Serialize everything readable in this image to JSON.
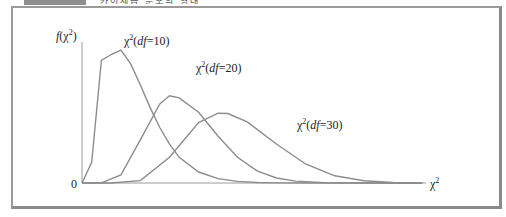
{
  "caption": {
    "tab_color": "#8f8f8f",
    "text": "카이제곱 분포의 형태"
  },
  "chart_data": {
    "type": "line",
    "title": "",
    "xlabel": "χ²",
    "ylabel": "f(χ²)",
    "origin_label": "0",
    "grid": false,
    "legend_position": "inline-labels",
    "x_range": [
      0,
      70
    ],
    "y_range": [
      0,
      0.1
    ],
    "values_source": "computed from the chi-square pdf f(x;k), not measured from the image (the plot has no y-axis ticks)",
    "pixel_mapping": {
      "note": "x pixel = origin_x + x * px_per_unit; y pixel = origin_y - f * px_per_density. px_per_unit fit so curves fade out near the observed convergence point (~x=400); approximate.",
      "origin_x": 82,
      "origin_y": 183,
      "px_per_unit": 4.86,
      "px_per_density": 1360
    },
    "series": [
      {
        "name": "χ²(df=10)",
        "df": 10,
        "mode_x": 8,
        "x": [
          0,
          2,
          4,
          6,
          8,
          10,
          12,
          14,
          16,
          18,
          20,
          24,
          28,
          32,
          36,
          40,
          50,
          60,
          70
        ],
        "values": [
          0,
          0.0153,
          0.0902,
          0.0945,
          0.0977,
          0.0877,
          0.0723,
          0.0556,
          0.0408,
          0.0286,
          0.0189,
          0.0081,
          0.0032,
          0.0012,
          0.0004,
          0.0001,
          0,
          0,
          0
        ]
      },
      {
        "name": "χ²(df=20)",
        "df": 20,
        "mode_x": 18,
        "x": [
          0,
          4,
          8,
          12,
          16,
          18,
          20,
          24,
          28,
          32,
          36,
          40,
          44,
          50,
          60,
          70
        ],
        "values": [
          0,
          0.0001,
          0.0059,
          0.0317,
          0.0581,
          0.0641,
          0.0626,
          0.052,
          0.0344,
          0.0189,
          0.009,
          0.0037,
          0.0014,
          0.0003,
          0,
          0
        ]
      },
      {
        "name": "χ²(df=30)",
        "df": 30,
        "mode_x": 28,
        "x": [
          0,
          6,
          12,
          18,
          24,
          28,
          30,
          34,
          40,
          46,
          52,
          58,
          64,
          70
        ],
        "values": [
          0,
          0,
          0.0018,
          0.0189,
          0.0445,
          0.0513,
          0.0511,
          0.0449,
          0.0287,
          0.014,
          0.0053,
          0.0016,
          0.0004,
          0.0001
        ]
      }
    ],
    "labels": [
      {
        "text_prefix": "χ",
        "sup": "2",
        "text_mid": "(",
        "italic": "df",
        "text_suffix": "=10)"
      },
      {
        "text_prefix": "χ",
        "sup": "2",
        "text_mid": "(",
        "italic": "df",
        "text_suffix": "=20)"
      },
      {
        "text_prefix": "χ",
        "sup": "2",
        "text_mid": "(",
        "italic": "df",
        "text_suffix": "=30)"
      }
    ],
    "colors": {
      "curve": "#8c8c8c",
      "axis": "#9a9a9a",
      "frame": "#9a9a9a",
      "text": "#222222"
    }
  }
}
